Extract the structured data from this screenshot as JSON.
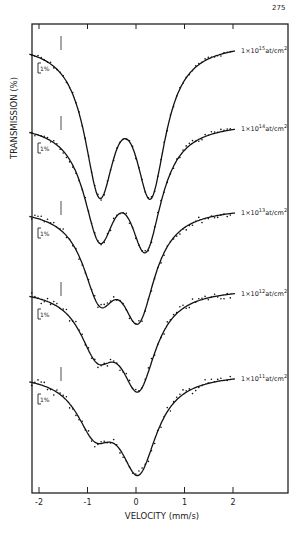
{
  "page_number": "275",
  "chart_data": {
    "type": "line",
    "title": "",
    "xlabel": "VELOCITY (mm/s)",
    "ylabel": "TRANSMISSION (%)",
    "xlim": [
      -2.2,
      3.1
    ],
    "xticks": [
      "-2",
      "-1",
      "0",
      "1",
      "2"
    ],
    "scale_bar": "1%",
    "grid": false,
    "legend_position": "inline-right",
    "series": [
      {
        "name": "1×10^15 at/cm^2",
        "label_main": "1×10",
        "exp": "15",
        "unit": "at/cm",
        "unit_exp": "2",
        "baseline_px": 42,
        "dips": [
          {
            "v": -0.75,
            "depth_px": 140
          },
          {
            "v": 0.3,
            "depth_px": 141
          }
        ],
        "peak_between": {
          "v": -0.25,
          "px": 98
        }
      },
      {
        "name": "1×10^14 at/cm^2",
        "label_main": "1×10",
        "exp": "14",
        "unit": "at/cm",
        "unit_exp": "2",
        "baseline_px": 122,
        "dips": [
          {
            "v": -0.75,
            "depth_px": 104
          },
          {
            "v": 0.2,
            "depth_px": 115
          }
        ],
        "peak_between": {
          "v": -0.3,
          "px": 208
        }
      },
      {
        "name": "1×10^13 at/cm^2",
        "label_main": "1×10",
        "exp": "13",
        "unit": "at/cm",
        "unit_exp": "2",
        "baseline_px": 207,
        "dips": [
          {
            "v": -0.75,
            "depth_px": 78
          },
          {
            "v": 0.05,
            "depth_px": 100
          }
        ],
        "peak_between": {
          "v": -0.4,
          "px": 262
        }
      },
      {
        "name": "1×10^12 at/cm^2",
        "label_main": "1×10",
        "exp": "12",
        "unit": "at/cm",
        "unit_exp": "2",
        "baseline_px": 288,
        "dips": [
          {
            "v": -0.8,
            "depth_px": 56
          },
          {
            "v": 0.05,
            "depth_px": 92
          }
        ],
        "peak_between": {
          "v": -0.5,
          "px": 336
        }
      },
      {
        "name": "1×10^11 at/cm^2",
        "label_main": "1×10",
        "exp": "11",
        "unit": "at/cm",
        "unit_exp": "2",
        "baseline_px": 373,
        "dips": [
          {
            "v": -0.85,
            "depth_px": 50
          },
          {
            "v": 0.05,
            "depth_px": 92
          }
        ],
        "peak_between": {
          "v": -0.55,
          "px": 418
        }
      }
    ]
  }
}
